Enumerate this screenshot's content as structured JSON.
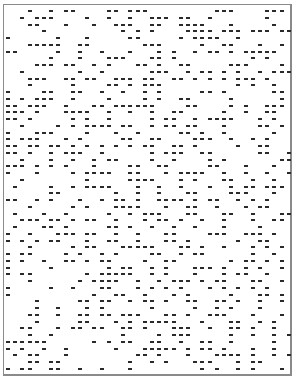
{
  "grid": {
    "origin_x": 6,
    "origin_y": 10,
    "step_x": 7.2,
    "step_y": 6.75,
    "dash_color": "#2a2a2a",
    "frame_color": "#8a8a8a",
    "rows": [
      "...#..#.##....##.###.........###....###.",
      "..#.###....#..#..#..###.##..#.......#...",
      "...##...#...#..###..##..####...#.....#..",
      ".....#..........#.#.#....####.###.###.##",
      "#......#...#.....##.....#.####..#.......",
      "...#####..##.......###.....#..##...#..#.",
      "##.....#..#..#...#...#.#..#.##.#.#####..",
      "......#...#...###...##.#..........#.#...",
      "....###.##..#.#...##.#..##.....###....#.",
      "..#.......#..#......###..#.##.#.#..#.###",
      "...###..##.##..###.##..##.#.#.#.###.#...",
      "...#.....#....##.#.###..........#.#..#..",
      "#....##..##..#..#..#.#.....##.#......##.",
      "#.#.###..#....#....#.#..##.....#......#.",
      "##.###..#...##.######....##....#.#..###.",
      "###.#...####..#..#..#..##.....#..#..##..",
      "##.#.....#.#..#.....#.##..#.####...#.#..",
      "..#....#.#.####.##..#.##.##...#....##.#.",
      "#...###....#...#..#.....##.#..#......#..",
      "#.###...#.#.....##..##....###..#..#.#...",
      "##.##.##.#.#.#.#.#.##..##.#.....#..##...",
      "##.#..#.###..#......#.###..##......##..#",
      "..#...#..#..#.##....#..#....#.#.......##",
      "###.#.#.#...#....##..##.....##...#...#..",
      "#...#....#.####..##...#.####..#..#..#..#",
      "..#........#.....####...#.#...##..#..#..",
      ".#....#..#.####...#..#..#...#..#.##.###.",
      "......##.......#..#..#...##....###...#..",
      "##..#.#...#..#.##.#..####.#.##..#.#.#...",
      "...#.....#.#...####...#..##..#...#.##...",
      ".#...#..#.....#..#.###...##...##..#...##",
      "..###.##.#.##..#...#.##.#..#..#...#..##.",
      ".#...##.#.....##.#..#..#..#...#....#....",
      "#..#...###.##..#..#...##....###..###.#..",
      "#.#.#.##...#..##..#...##.#......#..##...",
      "...#.....#.##...#####...##.#..#...#.#.#.",
      "#.##....#.#..#.#....##..#.##......#..#..",
      "#.#..#..##.#.##....#..##.......#.##.#.#.",
      "#.....#.......#.##..#.#...###.#..#.#..#.",
      "#.##.......#.#####..#.#...#...#.##..#...",
      "...#......#.####..#..#.###.#.##...##..#.",
      "#.....#..#...##...#.#.#.#...#.#.#.#.#...",
      "#...........#..##..#...#.#.....#...##.#.",
      "....#.....##.##..#.##.#..##..##.#..#..#.",
      "....#..#...#.#......#.....#..#.#...#....",
      "...##..#..##.##.###...##.#..###...#...#.",
      "....#.....##...#.#.#####...#...##..#.#..",
      "..##...#.##.##..##.#...###..#..##.#..#..",
      "...#..#.........#....#.###.....#..#..#.#",
      "######......#.#.##..##..#..##..#.....#..",
      "#.#..#..#......#...#####.#.##.#...#..#..",
      ".#.##...#.........##.#...#...####.#..#.#",
      "...##.##.........#..#.#...###...#.##....",
      "#.##..##..#..#...#.........#.#..#.#...#."
    ]
  }
}
